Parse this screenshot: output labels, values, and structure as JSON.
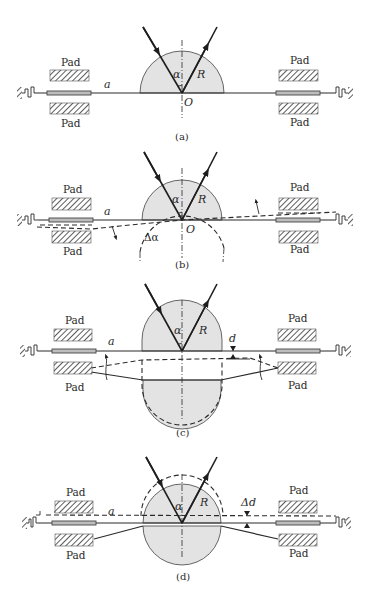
{
  "figure": {
    "panels": [
      {
        "id": "a",
        "caption": "(a)",
        "labels": {
          "pad_top_left": "Pad",
          "pad_bottom_left": "Pad",
          "pad_top_right": "Pad",
          "pad_bottom_right": "Pad",
          "plate": "a",
          "angle": "α",
          "radius": "R",
          "origin": "O"
        }
      },
      {
        "id": "b",
        "caption": "(b)",
        "labels": {
          "pad_top_left": "Pad",
          "pad_bottom_left": "Pad",
          "pad_top_right": "Pad",
          "pad_bottom_right": "Pad",
          "plate": "a",
          "angle": "α",
          "radius": "R",
          "origin": "O",
          "tilt": "Δα"
        }
      },
      {
        "id": "c",
        "caption": "(c)",
        "labels": {
          "pad_top_left": "Pad",
          "pad_bottom_left": "Pad",
          "pad_top_right": "Pad",
          "pad_bottom_right": "Pad",
          "plate": "a",
          "angle": "α",
          "radius": "R",
          "gap": "d"
        }
      },
      {
        "id": "d",
        "caption": "(d)",
        "labels": {
          "pad_top_left": "Pad",
          "pad_bottom_left": "Pad",
          "pad_top_right": "Pad",
          "pad_bottom_right": "Pad",
          "plate": "a",
          "angle": "α",
          "radius": "R",
          "gap_change": "Δd"
        }
      }
    ],
    "colors": {
      "line": "#2a2a2a",
      "mirror_fill": "#e3e3e3",
      "rod_fill": "#bdbdbd",
      "background": "#ffffff"
    }
  }
}
